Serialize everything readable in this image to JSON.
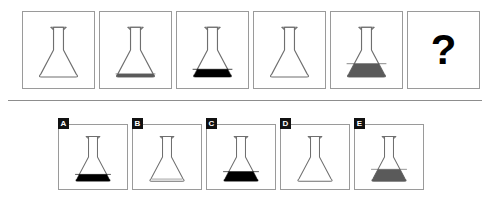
{
  "puzzle": {
    "type": "visual-analogy-sequence",
    "question_mark": "?",
    "sequence": [
      {
        "id": "seq-1",
        "fill_level": 0.0,
        "fill_color": "#ffffff",
        "label": "empty flask"
      },
      {
        "id": "seq-2",
        "fill_level": 0.12,
        "fill_color": "#5a5a5a",
        "label": "flask with low dark-gray liquid"
      },
      {
        "id": "seq-3",
        "fill_level": 0.3,
        "fill_color": "#000000",
        "label": "flask with black liquid"
      },
      {
        "id": "seq-4",
        "fill_level": 0.0,
        "fill_color": "#ffffff",
        "label": "empty flask"
      },
      {
        "id": "seq-5",
        "fill_level": 0.52,
        "fill_color": "#5a5a5a",
        "label": "flask with gray liquid"
      }
    ],
    "options": [
      {
        "letter": "A",
        "id": "option-a",
        "fill_level": 0.3,
        "fill_color": "#000000",
        "label": "flask with black liquid"
      },
      {
        "letter": "B",
        "id": "option-b",
        "fill_level": 0.04,
        "fill_color": "#ffffff",
        "label": "empty flask"
      },
      {
        "letter": "C",
        "id": "option-c",
        "fill_level": 0.42,
        "fill_color": "#000000",
        "label": "flask with tall black liquid"
      },
      {
        "letter": "D",
        "id": "option-d",
        "fill_level": 0.0,
        "fill_color": "#ffffff",
        "label": "empty flask"
      },
      {
        "letter": "E",
        "id": "option-e",
        "fill_level": 0.52,
        "fill_color": "#5a5a5a",
        "label": "flask with gray liquid"
      }
    ]
  },
  "colors": {
    "border": "#9a9a9a",
    "divider": "#8d8d8d",
    "outline": "#6f6f6f",
    "black_fill": "#000000",
    "gray_fill": "#5a5a5a",
    "badge_bg": "#111111",
    "badge_text": "#ffffff",
    "background": "#ffffff"
  }
}
